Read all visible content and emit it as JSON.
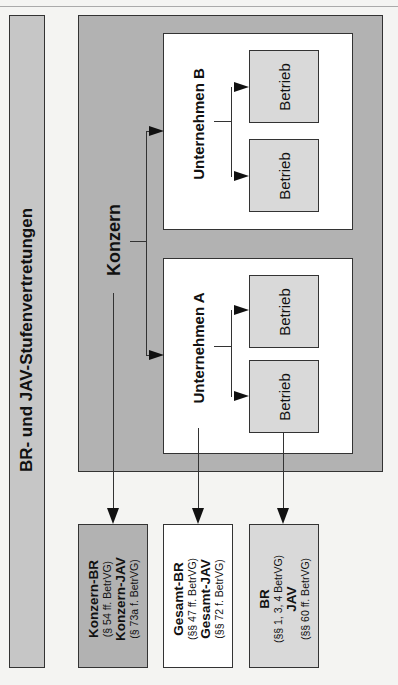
{
  "title": "BR- und JAV-Stufenvertretungen",
  "konzern": {
    "label": "Konzern"
  },
  "unternehmen": [
    {
      "label": "Unternehmen B",
      "betriebe": [
        "Betrieb",
        "Betrieb"
      ]
    },
    {
      "label": "Unternehmen A",
      "betriebe": [
        "Betrieb",
        "Betrieb"
      ]
    }
  ],
  "representations": [
    {
      "line1": "Konzern-BR",
      "ref1": "(§ 54 ff. BetrVG)",
      "line2": "Konzern-JAV",
      "ref2": "(§ 73a f. BetrVG)",
      "color": "#b2b2b2"
    },
    {
      "line1": "Gesamt-BR",
      "ref1": "(§§ 47 ff. BetrVG)",
      "line2": "Gesamt-JAV",
      "ref2": "(§§ 72 f. BetrVG)",
      "color": "#ffffff"
    },
    {
      "line1": "BR",
      "ref1": "(§§ 1, 3, 4 BetrVG)",
      "line2": "JAV",
      "ref2": "(§§ 60 ff. BetrVG)",
      "color": "#d9d9d9"
    }
  ],
  "colors": {
    "konzern": "#b2b2b2",
    "title_bar": "#c6c6c6",
    "betrieb": "#d9d9d9",
    "unternehmen": "#ffffff"
  }
}
